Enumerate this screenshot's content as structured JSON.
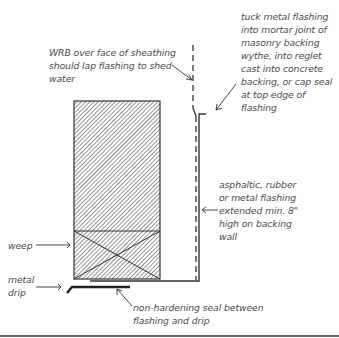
{
  "diagram": {
    "labels": {
      "wrb": [
        "WRB over face of sheathing",
        "should lap flashing to shed",
        "water"
      ],
      "tuck": [
        "tuck metal flashing",
        "into mortar joint of",
        "masonry backing",
        "wythe, into reglet",
        "cast into concrete",
        "backing, or cap seal",
        "at top edge of",
        "flashing"
      ],
      "flashing": [
        "asphaltic, rubber",
        "or metal flashing",
        "extended min. 8\"",
        "high on backing",
        "wall"
      ],
      "weep": [
        "weep"
      ],
      "drip": [
        "metal",
        "drip"
      ],
      "seal": [
        "non-hardening seal between",
        "flashing and drip"
      ]
    },
    "colors": {
      "line": "#333333",
      "text": "#4a4a4a",
      "hatch": "#3a3a3a",
      "background": "#ffffff"
    }
  }
}
